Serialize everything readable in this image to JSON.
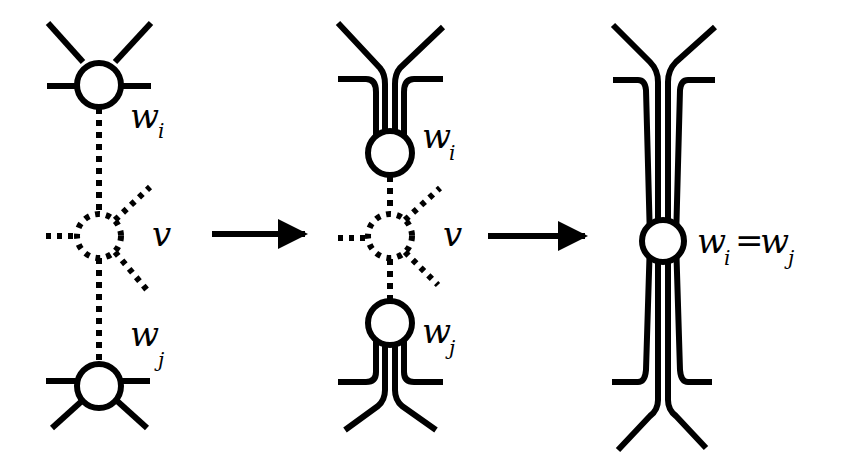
{
  "diagram": {
    "colors": {
      "stroke": "#000000",
      "background": "#ffffff"
    },
    "panels": [
      {
        "id": "panel-1",
        "nodes": [
          {
            "id": "w_i",
            "label": "w",
            "subscript": "i",
            "style": "solid"
          },
          {
            "id": "v",
            "label": "v",
            "style": "dotted"
          },
          {
            "id": "w_j",
            "label": "w",
            "subscript": "j",
            "style": "solid"
          }
        ]
      },
      {
        "id": "panel-2",
        "nodes": [
          {
            "id": "w_i",
            "label": "w",
            "subscript": "i",
            "style": "solid"
          },
          {
            "id": "v",
            "label": "v",
            "style": "dotted"
          },
          {
            "id": "w_j",
            "label": "w",
            "subscript": "j",
            "style": "solid"
          }
        ]
      },
      {
        "id": "panel-3",
        "nodes": [
          {
            "id": "w_i=w_j",
            "label": "w",
            "subscript": "i",
            "equals": "=",
            "label2": "w",
            "subscript2": "j",
            "style": "solid"
          }
        ]
      }
    ],
    "arrows": [
      {
        "from": "panel-1",
        "to": "panel-2",
        "icon": "right-arrow-icon"
      },
      {
        "from": "panel-2",
        "to": "panel-3",
        "icon": "right-arrow-icon"
      }
    ]
  },
  "labels": {
    "p1_wi": "w",
    "p1_wi_sub": "i",
    "p1_v": "v",
    "p1_wj": "w",
    "p1_wj_sub": "j",
    "p2_wi": "w",
    "p2_wi_sub": "i",
    "p2_v": "v",
    "p2_wj": "w",
    "p2_wj_sub": "j",
    "p3_w1": "w",
    "p3_w1_sub": "i",
    "p3_eq": "=",
    "p3_w2": "w",
    "p3_w2_sub": "j"
  }
}
